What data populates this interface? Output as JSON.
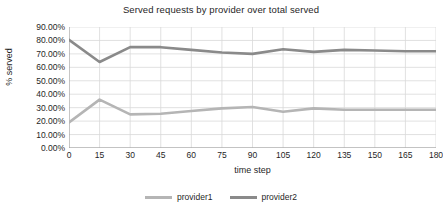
{
  "chart_data": {
    "type": "line",
    "title": "Served requests by provider over total served",
    "xlabel": "time step",
    "ylabel": "% served",
    "x": [
      0,
      15,
      30,
      45,
      60,
      75,
      90,
      105,
      120,
      135,
      150,
      165,
      180
    ],
    "xtick_labels": [
      "0",
      "15",
      "30",
      "45",
      "60",
      "75",
      "90",
      "105",
      "120",
      "135",
      "150",
      "165",
      "180"
    ],
    "ytick_labels": [
      "0.00%",
      "10.00%",
      "20.00%",
      "30.00%",
      "40.00%",
      "50.00%",
      "60.00%",
      "70.00%",
      "80.00%",
      "90.00%"
    ],
    "ytick_values": [
      0,
      10,
      20,
      30,
      40,
      50,
      60,
      70,
      80,
      90
    ],
    "xlim": [
      0,
      180
    ],
    "ylim": [
      0,
      90
    ],
    "grid": true,
    "legend_position": "bottom",
    "series": [
      {
        "name": "provider1",
        "color": "#b5b5b5",
        "values": [
          19.0,
          36.0,
          25.0,
          25.5,
          27.5,
          29.5,
          30.5,
          27.0,
          29.5,
          28.5,
          28.5,
          28.5,
          28.5
        ]
      },
      {
        "name": "provider2",
        "color": "#8a8a8a",
        "values": [
          80.5,
          64.0,
          75.0,
          75.0,
          73.0,
          71.0,
          70.0,
          73.5,
          71.5,
          73.0,
          72.5,
          72.0,
          72.0
        ]
      }
    ]
  },
  "axes": {
    "grid_color": "#d9d9d9",
    "axis_color": "#9a9a9a"
  }
}
